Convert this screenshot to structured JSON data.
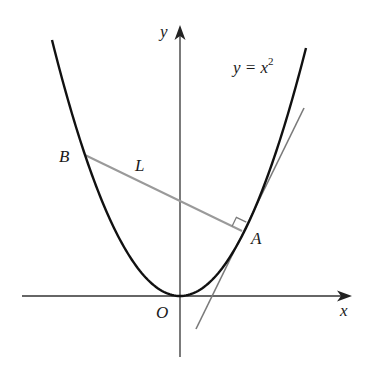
{
  "figure": {
    "type": "diagram",
    "colors": {
      "parabola": "#111111",
      "axes": "#333333",
      "tangent": "#7a7a7a",
      "normal": "#9a9a9a",
      "right_angle": "#7a7a7a",
      "text": "#1a1a1a"
    },
    "labels": {
      "x_axis": "x",
      "y_axis": "y",
      "origin": "O",
      "point_a": "A",
      "point_b": "B",
      "line_l": "L",
      "curve_equation_lhs": "y = x",
      "curve_equation_exp": "2"
    },
    "geometry": {
      "origin_px": [
        180,
        296
      ],
      "parabola_scale": 0.015625,
      "point_a_px": [
        242,
        231
      ],
      "point_b_px": [
        85,
        155
      ],
      "tangent_from_px": [
        196,
        329
      ],
      "tangent_to_px": [
        304,
        108
      ],
      "x_axis_from_px": [
        22,
        296
      ],
      "x_axis_to_px": [
        352,
        296
      ],
      "y_axis_from_px": [
        180,
        357
      ],
      "y_axis_to_px": [
        180,
        25
      ]
    }
  }
}
